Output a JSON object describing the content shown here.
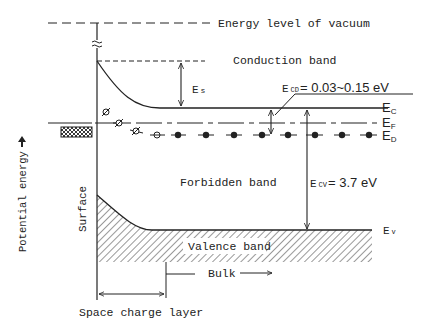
{
  "labels": {
    "vacuum": "Energy level of vacuum",
    "conduction_band": "Conduction band",
    "forbidden_band": "Forbidden band",
    "valence_band": "Valence band",
    "surface": "Surface",
    "bulk": "Bulk",
    "space_charge_layer": "Space charge layer",
    "potential_energy": "Potential energy",
    "es_main": "E",
    "es_sub": "s",
    "ecd_main": "E",
    "ecd_sub": "CD",
    "ecd_value": "= 0.03~0.15 eV",
    "ecv_main": "E",
    "ecv_sub": "CV",
    "ecv_value": "= 3.7  eV",
    "ec_main": "E",
    "ec_sub": "C",
    "ef_main": "E",
    "ef_sub": "F",
    "ed_main": "E",
    "ed_sub": "D",
    "ev_main": "E",
    "ev_sub": "v"
  },
  "colors": {
    "ink": "#222222",
    "background": "#ffffff"
  }
}
